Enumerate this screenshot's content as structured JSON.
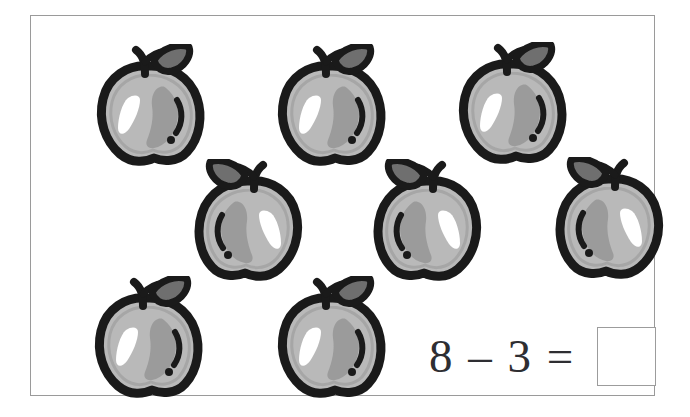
{
  "worksheet": {
    "kind": "arithmetic-picture-worksheet",
    "frame_border_color": "#9a9a9a",
    "background_color": "#ffffff"
  },
  "problem": {
    "equation_text": "8 – 3 =",
    "minuend": 8,
    "subtrahend": 3,
    "operator": "–",
    "equals": "=",
    "answer_value": "",
    "answer_placeholder": "",
    "text_color": "#2e2e32",
    "answer_box_border_color": "#9c9c9c"
  },
  "counters": {
    "icon_name": "apple-icon",
    "total": 8,
    "label": "apple",
    "colors": {
      "outline": "#1a1a1a",
      "body": "#b9b9b9",
      "shade": "#9b9b9b",
      "highlight": "#ffffff",
      "leaf": "#6f6f6f",
      "seed_dot": "#1a1a1a"
    },
    "rows": [
      {
        "row_index": 0,
        "count": 3,
        "mirrored": false,
        "items": [
          {
            "name": "apple-1",
            "x": 57,
            "y": 28
          },
          {
            "name": "apple-2",
            "x": 238,
            "y": 28
          },
          {
            "name": "apple-3",
            "x": 419,
            "y": 26
          }
        ]
      },
      {
        "row_index": 1,
        "count": 3,
        "mirrored": true,
        "items": [
          {
            "name": "apple-4",
            "x": 158,
            "y": 143
          },
          {
            "name": "apple-5",
            "x": 337,
            "y": 143
          },
          {
            "name": "apple-6",
            "x": 519,
            "y": 141
          }
        ]
      },
      {
        "row_index": 2,
        "count": 2,
        "mirrored": false,
        "items": [
          {
            "name": "apple-7",
            "x": 55,
            "y": 260
          },
          {
            "name": "apple-8",
            "x": 238,
            "y": 260
          }
        ]
      }
    ]
  }
}
